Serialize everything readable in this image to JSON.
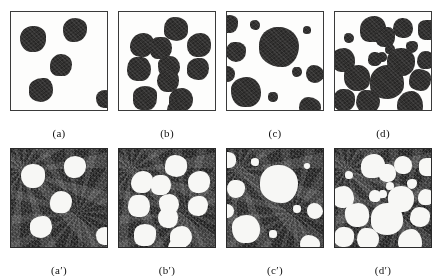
{
  "figure": {
    "layout": "2 rows x 4 columns of binary blob images",
    "colors": {
      "page_background": "#ffffff",
      "panel_border": "#3a3a3a",
      "blob_dark": "#333231",
      "blob_light": "#f7f7f5",
      "noise_background": "#2b2b2b",
      "caption_text": "#111111"
    }
  },
  "panels": {
    "top": [
      {
        "id": "panel-a",
        "caption": "(a)",
        "polarity": "dark-blobs-on-white",
        "blob_count": 5,
        "blobs": [
          {
            "cx": 22,
            "cy": 27,
            "r": 13
          },
          {
            "cx": 64,
            "cy": 18,
            "r": 12
          },
          {
            "cx": 50,
            "cy": 53,
            "r": 11
          },
          {
            "cx": 30,
            "cy": 78,
            "r": 12
          },
          {
            "cx": 94,
            "cy": 87,
            "r": 9
          }
        ]
      },
      {
        "id": "panel-b",
        "caption": "(b)",
        "polarity": "dark-blobs-on-white",
        "blob_count": 11,
        "blobs": [
          {
            "cx": 57,
            "cy": 17,
            "r": 12
          },
          {
            "cx": 23,
            "cy": 33,
            "r": 12
          },
          {
            "cx": 42,
            "cy": 36,
            "r": 11
          },
          {
            "cx": 80,
            "cy": 33,
            "r": 12
          },
          {
            "cx": 20,
            "cy": 57,
            "r": 12
          },
          {
            "cx": 50,
            "cy": 55,
            "r": 11
          },
          {
            "cx": 79,
            "cy": 57,
            "r": 11
          },
          {
            "cx": 49,
            "cy": 69,
            "r": 11
          },
          {
            "cx": 26,
            "cy": 86,
            "r": 12
          },
          {
            "cx": 62,
            "cy": 88,
            "r": 12
          },
          {
            "cx": 58,
            "cy": 98,
            "r": 10
          }
        ]
      },
      {
        "id": "panel-c",
        "caption": "(c)",
        "polarity": "dark-blobs-on-white",
        "blob_count": 10,
        "blobs": [
          {
            "cx": 2,
            "cy": 12,
            "r": 9
          },
          {
            "cx": 28,
            "cy": 13,
            "r": 5
          },
          {
            "cx": 52,
            "cy": 35,
            "r": 20
          },
          {
            "cx": 80,
            "cy": 18,
            "r": 4
          },
          {
            "cx": 9,
            "cy": 40,
            "r": 10
          },
          {
            "cx": 0,
            "cy": 62,
            "r": 8
          },
          {
            "cx": 70,
            "cy": 60,
            "r": 5
          },
          {
            "cx": 88,
            "cy": 62,
            "r": 9
          },
          {
            "cx": 19,
            "cy": 80,
            "r": 15
          },
          {
            "cx": 46,
            "cy": 85,
            "r": 5
          },
          {
            "cx": 83,
            "cy": 96,
            "r": 11
          }
        ]
      },
      {
        "id": "panel-d",
        "caption": "(d)",
        "polarity": "dark-blobs-on-white",
        "blob_count": 18,
        "blobs": [
          {
            "cx": 38,
            "cy": 17,
            "r": 13
          },
          {
            "cx": 50,
            "cy": 25,
            "r": 10
          },
          {
            "cx": 68,
            "cy": 16,
            "r": 10
          },
          {
            "cx": 93,
            "cy": 18,
            "r": 10
          },
          {
            "cx": 14,
            "cy": 26,
            "r": 5
          },
          {
            "cx": 55,
            "cy": 37,
            "r": 5
          },
          {
            "cx": 77,
            "cy": 35,
            "r": 6
          },
          {
            "cx": 8,
            "cy": 48,
            "r": 12
          },
          {
            "cx": 40,
            "cy": 47,
            "r": 7
          },
          {
            "cx": 47,
            "cy": 45,
            "r": 5
          },
          {
            "cx": 66,
            "cy": 50,
            "r": 14
          },
          {
            "cx": 91,
            "cy": 48,
            "r": 9
          },
          {
            "cx": 22,
            "cy": 66,
            "r": 13
          },
          {
            "cx": 52,
            "cy": 70,
            "r": 17
          },
          {
            "cx": 85,
            "cy": 68,
            "r": 11
          },
          {
            "cx": 9,
            "cy": 88,
            "r": 11
          },
          {
            "cx": 33,
            "cy": 90,
            "r": 12
          },
          {
            "cx": 75,
            "cy": 92,
            "r": 13
          }
        ]
      }
    ],
    "bottom": [
      {
        "id": "panel-a-prime",
        "caption": "(a′)",
        "polarity": "white-blobs-on-dark-noise",
        "blob_count": 5,
        "blobs": [
          {
            "cx": 22,
            "cy": 27,
            "r": 12
          },
          {
            "cx": 64,
            "cy": 18,
            "r": 11
          },
          {
            "cx": 50,
            "cy": 53,
            "r": 11
          },
          {
            "cx": 30,
            "cy": 78,
            "r": 11
          },
          {
            "cx": 94,
            "cy": 87,
            "r": 9
          }
        ]
      },
      {
        "id": "panel-b-prime",
        "caption": "(b′)",
        "polarity": "white-blobs-on-dark-noise",
        "blob_count": 11,
        "blobs": [
          {
            "cx": 57,
            "cy": 17,
            "r": 11
          },
          {
            "cx": 23,
            "cy": 33,
            "r": 11
          },
          {
            "cx": 42,
            "cy": 36,
            "r": 10
          },
          {
            "cx": 80,
            "cy": 33,
            "r": 11
          },
          {
            "cx": 20,
            "cy": 57,
            "r": 11
          },
          {
            "cx": 50,
            "cy": 55,
            "r": 10
          },
          {
            "cx": 79,
            "cy": 57,
            "r": 10
          },
          {
            "cx": 49,
            "cy": 69,
            "r": 10
          },
          {
            "cx": 26,
            "cy": 86,
            "r": 11
          },
          {
            "cx": 62,
            "cy": 88,
            "r": 11
          },
          {
            "cx": 58,
            "cy": 99,
            "r": 9
          }
        ]
      },
      {
        "id": "panel-c-prime",
        "caption": "(c′)",
        "polarity": "white-blobs-on-dark-noise",
        "blob_count": 11,
        "blobs": [
          {
            "cx": 1,
            "cy": 11,
            "r": 8
          },
          {
            "cx": 28,
            "cy": 13,
            "r": 4
          },
          {
            "cx": 52,
            "cy": 35,
            "r": 19
          },
          {
            "cx": 80,
            "cy": 17,
            "r": 3
          },
          {
            "cx": 9,
            "cy": 40,
            "r": 9
          },
          {
            "cx": 0,
            "cy": 62,
            "r": 7
          },
          {
            "cx": 70,
            "cy": 60,
            "r": 4
          },
          {
            "cx": 88,
            "cy": 62,
            "r": 8
          },
          {
            "cx": 19,
            "cy": 80,
            "r": 14
          },
          {
            "cx": 46,
            "cy": 85,
            "r": 4
          },
          {
            "cx": 83,
            "cy": 96,
            "r": 10
          }
        ]
      },
      {
        "id": "panel-d-prime",
        "caption": "(d′)",
        "polarity": "white-blobs-on-dark-noise",
        "blob_count": 18,
        "blobs": [
          {
            "cx": 38,
            "cy": 17,
            "r": 12
          },
          {
            "cx": 52,
            "cy": 24,
            "r": 9
          },
          {
            "cx": 68,
            "cy": 16,
            "r": 9
          },
          {
            "cx": 93,
            "cy": 18,
            "r": 9
          },
          {
            "cx": 14,
            "cy": 26,
            "r": 4
          },
          {
            "cx": 55,
            "cy": 37,
            "r": 4
          },
          {
            "cx": 77,
            "cy": 35,
            "r": 5
          },
          {
            "cx": 8,
            "cy": 48,
            "r": 11
          },
          {
            "cx": 40,
            "cy": 47,
            "r": 6
          },
          {
            "cx": 48,
            "cy": 45,
            "r": 4
          },
          {
            "cx": 66,
            "cy": 50,
            "r": 13
          },
          {
            "cx": 91,
            "cy": 48,
            "r": 8
          },
          {
            "cx": 22,
            "cy": 66,
            "r": 12
          },
          {
            "cx": 52,
            "cy": 70,
            "r": 16
          },
          {
            "cx": 85,
            "cy": 68,
            "r": 10
          },
          {
            "cx": 9,
            "cy": 88,
            "r": 10
          },
          {
            "cx": 33,
            "cy": 90,
            "r": 11
          },
          {
            "cx": 75,
            "cy": 92,
            "r": 12
          }
        ]
      }
    ]
  },
  "captions": {
    "a": "(a)",
    "b": "(b)",
    "c": "(c)",
    "d": "(d)",
    "a_prime": "(a′)",
    "b_prime": "(b′)",
    "c_prime": "(c′)",
    "d_prime": "(d′)"
  }
}
